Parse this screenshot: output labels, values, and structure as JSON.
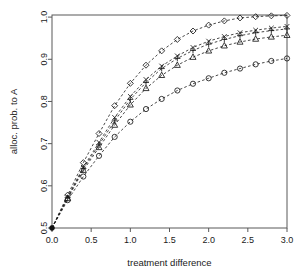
{
  "chart_data": {
    "type": "line",
    "title": "",
    "subtitle": "",
    "xlabel": "treatment difference",
    "ylabel": "alloc. prob. to A",
    "xlim": [
      0.0,
      3.0
    ],
    "ylim": [
      0.5,
      1.005
    ],
    "grid": false,
    "legend": "none",
    "xticks": [
      "0.0",
      "0.5",
      "1.0",
      "1.5",
      "2.0",
      "2.5",
      "3.0"
    ],
    "xtick_values": [
      0.0,
      0.5,
      1.0,
      1.5,
      2.0,
      2.5,
      3.0
    ],
    "yticks": [
      "0.5",
      "0.6",
      "0.7",
      "0.8",
      "0.9",
      "1.0"
    ],
    "ytick_values": [
      0.5,
      0.6,
      0.7,
      0.8,
      0.9,
      1.0
    ],
    "x": [
      0.0,
      0.2,
      0.4,
      0.6,
      0.8,
      1.0,
      1.2,
      1.4,
      1.6,
      1.8,
      2.0,
      2.2,
      2.4,
      2.6,
      2.8,
      3.0
    ],
    "line_style": "dashed",
    "series": [
      {
        "name": "diamond-series",
        "marker": "diamond",
        "values": [
          0.5,
          0.578,
          0.655,
          0.724,
          0.79,
          0.843,
          0.886,
          0.92,
          0.947,
          0.967,
          0.981,
          0.991,
          0.998,
          1.001,
          1.003,
          1.004
        ]
      },
      {
        "name": "cross-series",
        "marker": "cross",
        "values": [
          0.5,
          0.574,
          0.644,
          0.703,
          0.762,
          0.812,
          0.852,
          0.884,
          0.908,
          0.928,
          0.943,
          0.954,
          0.963,
          0.969,
          0.974,
          0.978
        ]
      },
      {
        "name": "plus-series",
        "marker": "plus",
        "values": [
          0.5,
          0.572,
          0.641,
          0.697,
          0.754,
          0.805,
          0.845,
          0.878,
          0.902,
          0.921,
          0.936,
          0.947,
          0.956,
          0.963,
          0.968,
          0.972
        ]
      },
      {
        "name": "triangle-series",
        "marker": "triangle",
        "values": [
          0.5,
          0.57,
          0.637,
          0.691,
          0.744,
          0.792,
          0.831,
          0.862,
          0.886,
          0.905,
          0.92,
          0.932,
          0.941,
          0.948,
          0.953,
          0.957
        ]
      },
      {
        "name": "circle-series",
        "marker": "circle",
        "values": [
          0.5,
          0.566,
          0.622,
          0.671,
          0.716,
          0.752,
          0.782,
          0.806,
          0.826,
          0.842,
          0.855,
          0.868,
          0.878,
          0.888,
          0.896,
          0.902
        ]
      }
    ],
    "origin_point": {
      "x": 0.0,
      "y": 0.5,
      "marker": "filled-circle"
    }
  }
}
